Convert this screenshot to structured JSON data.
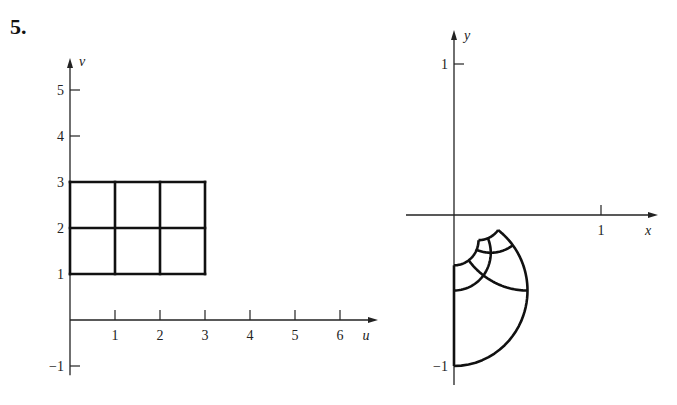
{
  "problem": {
    "number": "5."
  },
  "chart_data": [
    {
      "type": "line",
      "title": "Region in uv-plane",
      "xlabel": "u",
      "ylabel": "v",
      "xlim": [
        0,
        7
      ],
      "ylim": [
        -1,
        5.5
      ],
      "xticks": [
        "1",
        "2",
        "3",
        "4",
        "5",
        "6"
      ],
      "yticks": [
        "−1",
        "1",
        "2",
        "3",
        "4",
        "5"
      ],
      "grid": false,
      "region": {
        "u_range": [
          0,
          3
        ],
        "v_range": [
          1,
          3
        ]
      },
      "series": [
        {
          "name": "u-lines",
          "u_values": [
            0,
            1,
            2,
            3
          ],
          "v_from": 1,
          "v_to": 3
        },
        {
          "name": "v-lines",
          "v_values": [
            1,
            2,
            3
          ],
          "u_from": 0,
          "u_to": 3
        }
      ]
    },
    {
      "type": "line",
      "title": "Image region in xy-plane",
      "xlabel": "x",
      "ylabel": "y",
      "xlim": [
        -0.3,
        1.3
      ],
      "ylim": [
        -1.05,
        1.1
      ],
      "xticks": [
        "1"
      ],
      "yticks": [
        "1",
        "−1"
      ],
      "grid": false,
      "mapping": "x = u/(u^2+v^2), y = -v/(u^2+v^2)",
      "series": [
        {
          "name": "images of u = const",
          "u_values": [
            0,
            1,
            2,
            3
          ],
          "v_from": 1,
          "v_to": 3
        },
        {
          "name": "images of v = const",
          "v_values": [
            1,
            2,
            3
          ],
          "u_from": 0,
          "u_to": 3
        }
      ]
    }
  ]
}
